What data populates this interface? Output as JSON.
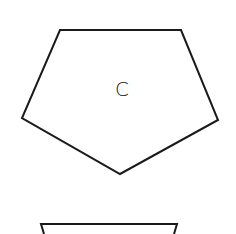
{
  "diagram": {
    "shapes": [
      {
        "type": "pentagon",
        "label": "C",
        "points": "60,30 181,30 218,120 120,174 22,118",
        "stroke": "#1a1a1a",
        "fill": "#ffffff"
      },
      {
        "type": "partial-shape",
        "label": "",
        "points": "44,234 41,224 177,224 174,234",
        "stroke": "#1a1a1a",
        "fill": "#ffffff"
      }
    ]
  }
}
